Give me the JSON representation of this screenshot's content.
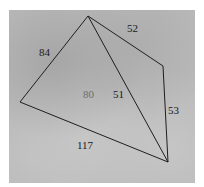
{
  "diagram": {
    "type": "quadrilateral-with-diagonal",
    "background_color": "#b9b9b9",
    "line_color": "#1e1e1e",
    "vertices": {
      "top": {
        "x": 88,
        "y": 16
      },
      "right": {
        "x": 163,
        "y": 66
      },
      "bottom": {
        "x": 168,
        "y": 162
      },
      "left": {
        "x": 20,
        "y": 102
      }
    },
    "edges": [
      {
        "from": "left",
        "to": "top",
        "label": "84"
      },
      {
        "from": "top",
        "to": "right",
        "label": "52"
      },
      {
        "from": "right",
        "to": "bottom",
        "label": "53"
      },
      {
        "from": "bottom",
        "to": "left",
        "label": "117"
      },
      {
        "from": "top",
        "to": "bottom",
        "label": "51",
        "kind": "diagonal"
      }
    ],
    "labels": {
      "edge_left_top": "84",
      "edge_top_right": "52",
      "edge_right_bottom": "53",
      "edge_bottom_left": "117",
      "diagonal_top_bottom": "51",
      "region_left": "80"
    }
  }
}
